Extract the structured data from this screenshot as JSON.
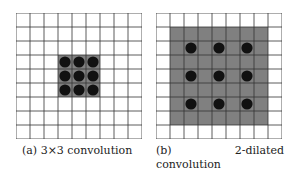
{
  "figures": [
    {
      "id": "a",
      "caption": "(a) 3×3 convolution",
      "grid_cells": 9,
      "receptive_field": {
        "start_row": 3,
        "start_col": 3,
        "size": 3
      },
      "kernel_points": {
        "start_row": 3,
        "start_col": 3,
        "count": 3,
        "dilation": 1
      }
    },
    {
      "id": "b",
      "caption": "(b) 2-dilated convolution",
      "grid_cells": 9,
      "receptive_field": {
        "start_row": 1,
        "start_col": 1,
        "size": 7
      },
      "kernel_points": {
        "start_row": 2,
        "start_col": 2,
        "count": 3,
        "dilation": 2
      }
    }
  ],
  "colors": {
    "shade": "#808080",
    "dot": "#111111",
    "line": "#333333"
  }
}
